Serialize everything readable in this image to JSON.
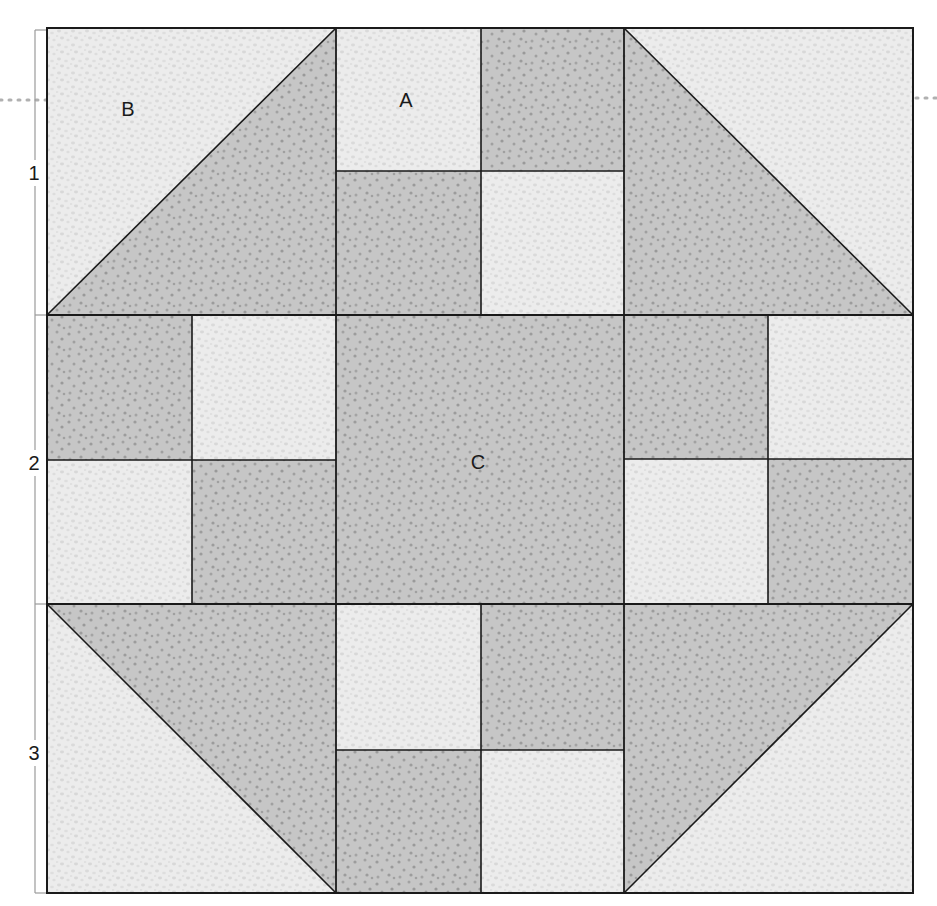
{
  "diagram": {
    "type": "quilt-block",
    "block_name_visible": false,
    "colors": {
      "light_fabric": "#ececec",
      "light_dot": "#d6d6d6",
      "dark_fabric": "#c4c4c4",
      "dark_dot": "#9a9a9a",
      "seam_line": "#1a1a1a",
      "ruler_line": "#9a9a9a",
      "guide_dots": "#b0b0b0"
    },
    "piece_labels": [
      {
        "id": "B",
        "text": "B",
        "x": 128,
        "y": 109
      },
      {
        "id": "A",
        "text": "A",
        "x": 406,
        "y": 107
      },
      {
        "id": "C",
        "text": "C",
        "x": 478,
        "y": 470
      }
    ],
    "row_labels": [
      {
        "text": "1",
        "x": 34,
        "y": 180
      },
      {
        "text": "2",
        "x": 34,
        "y": 470
      },
      {
        "text": "3",
        "x": 34,
        "y": 760
      }
    ],
    "rows": [
      {
        "row": 1,
        "units": [
          {
            "pos": "left",
            "kind": "half-square-triangle",
            "light": "top-left",
            "dark": "bottom-right"
          },
          {
            "pos": "center",
            "kind": "four-patch",
            "cells": [
              "light",
              "dark",
              "dark",
              "light"
            ]
          },
          {
            "pos": "right",
            "kind": "half-square-triangle",
            "light": "top-right",
            "dark": "bottom-left"
          }
        ]
      },
      {
        "row": 2,
        "units": [
          {
            "pos": "left",
            "kind": "four-patch",
            "cells": [
              "dark",
              "light",
              "light",
              "dark"
            ]
          },
          {
            "pos": "center",
            "kind": "square",
            "fabric": "dark"
          },
          {
            "pos": "right",
            "kind": "four-patch",
            "cells": [
              "dark",
              "light",
              "light",
              "dark"
            ]
          }
        ]
      },
      {
        "row": 3,
        "units": [
          {
            "pos": "left",
            "kind": "half-square-triangle",
            "light": "bottom-left",
            "dark": "top-right"
          },
          {
            "pos": "center",
            "kind": "four-patch",
            "cells": [
              "light",
              "dark",
              "dark",
              "light"
            ]
          },
          {
            "pos": "right",
            "kind": "half-square-triangle",
            "light": "bottom-right",
            "dark": "top-left"
          }
        ]
      }
    ]
  }
}
